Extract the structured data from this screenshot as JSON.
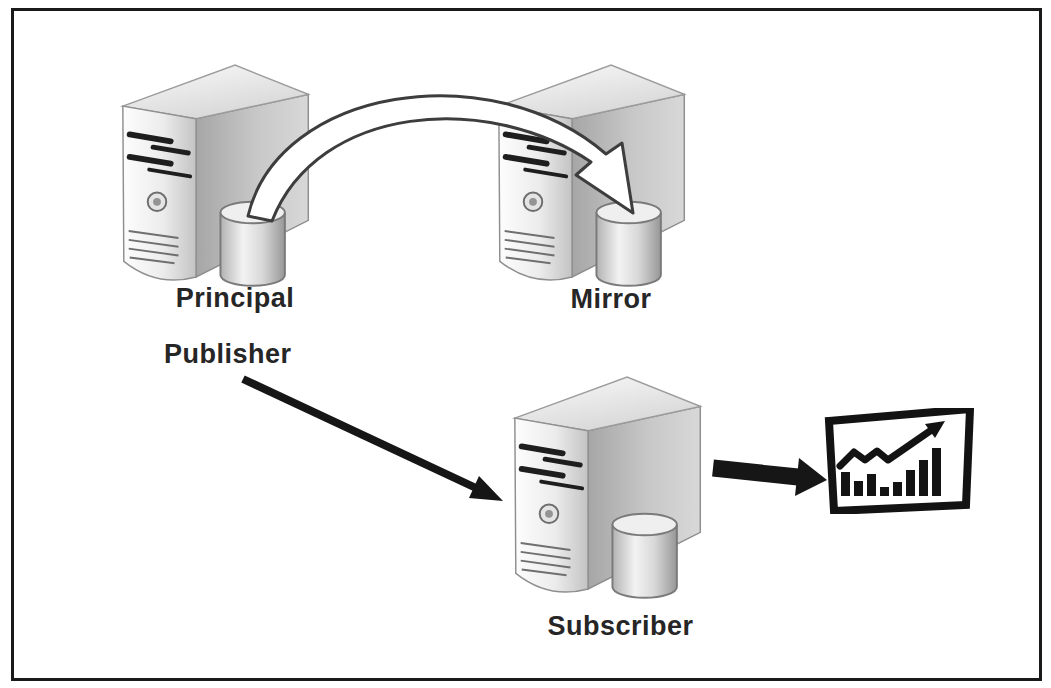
{
  "labels": {
    "principal": "Principal",
    "mirror": "Mirror",
    "publisher": "Publisher",
    "subscriber": "Subscriber"
  },
  "nodes": [
    {
      "id": "principal",
      "labels": [
        "Principal",
        "Publisher"
      ],
      "icon": "server-tower-with-database-cylinder"
    },
    {
      "id": "mirror",
      "labels": [
        "Mirror"
      ],
      "icon": "server-tower-with-database-cylinder"
    },
    {
      "id": "subscriber",
      "labels": [
        "Subscriber"
      ],
      "icon": "server-tower-with-database-cylinder"
    },
    {
      "id": "report",
      "labels": [],
      "icon": "bar-chart-report"
    }
  ],
  "connections": [
    {
      "from": "principal",
      "to": "mirror",
      "style": "curved-hollow-outline-arrow"
    },
    {
      "from": "publisher",
      "to": "subscriber",
      "style": "straight-solid-arrow"
    },
    {
      "from": "subscriber",
      "to": "report",
      "style": "thick-solid-arrow"
    }
  ],
  "colors": {
    "background": "#ffffff",
    "frame_border": "#1a1a1a",
    "label_text": "#262626",
    "arrow_solid": "#161616",
    "ribbon_outline": "#3d3d3d",
    "icon_black": "#131313"
  }
}
